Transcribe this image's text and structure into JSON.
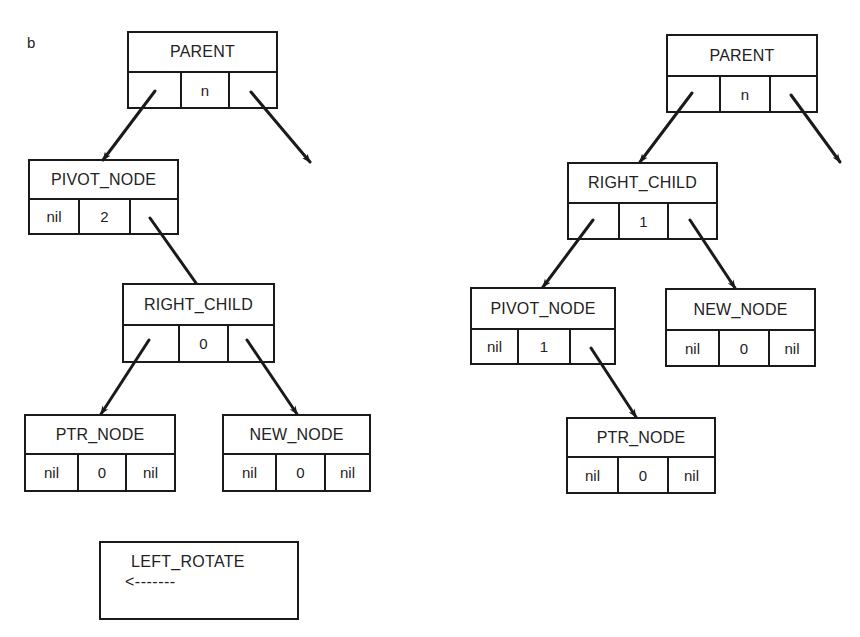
{
  "panel_label": "b",
  "operation": {
    "name": "LEFT_ROTATE",
    "arrow": "<-------"
  },
  "before": {
    "parent": {
      "name": "PARENT",
      "left": "",
      "balance": "n",
      "right": ""
    },
    "pivot_node": {
      "name": "PIVOT_NODE",
      "left": "nil",
      "balance": "2",
      "right": ""
    },
    "right_child": {
      "name": "RIGHT_CHILD",
      "left": "",
      "balance": "0",
      "right": ""
    },
    "ptr_node": {
      "name": "PTR_NODE",
      "left": "nil",
      "balance": "0",
      "right": "nil"
    },
    "new_node": {
      "name": "NEW_NODE",
      "left": "nil",
      "balance": "0",
      "right": "nil"
    }
  },
  "after": {
    "parent": {
      "name": "PARENT",
      "left": "",
      "balance": "n",
      "right": ""
    },
    "right_child": {
      "name": "RIGHT_CHILD",
      "left": "",
      "balance": "1",
      "right": ""
    },
    "pivot_node": {
      "name": "PIVOT_NODE",
      "left": "nil",
      "balance": "1",
      "right": ""
    },
    "new_node": {
      "name": "NEW_NODE",
      "left": "nil",
      "balance": "0",
      "right": "nil"
    },
    "ptr_node": {
      "name": "PTR_NODE",
      "left": "nil",
      "balance": "0",
      "right": "nil"
    }
  },
  "colors": {
    "stroke": "#1a1a1a",
    "background": "#ffffff"
  }
}
